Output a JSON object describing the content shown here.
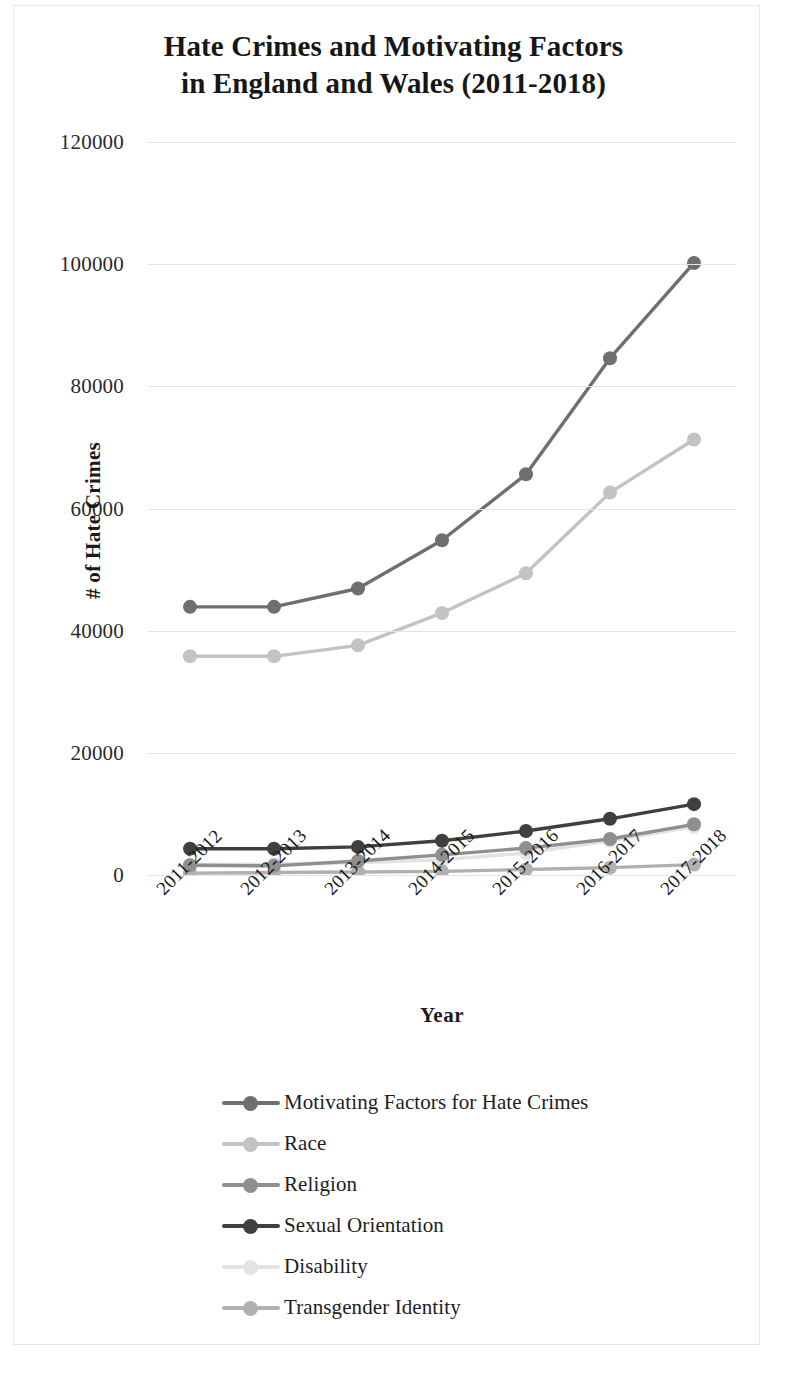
{
  "title": {
    "line1": "Hate Crimes and Motivating Factors",
    "line2": "in England and Wales (2011-2018)"
  },
  "axes": {
    "ylabel": "# of Hate Crimes",
    "xlabel": "Year",
    "yticks": [
      "0",
      "20000",
      "40000",
      "60000",
      "80000",
      "100000",
      "120000"
    ],
    "xticks": [
      "2011-2012",
      "2012-2013",
      "2013-2014",
      "2014-2015",
      "2015-2016",
      "2016-2017",
      "2017-2018"
    ]
  },
  "legend": {
    "items": [
      {
        "label": "Motivating Factors for Hate Crimes",
        "color": "#6f6f6f"
      },
      {
        "label": "Race",
        "color": "#c3c3c3"
      },
      {
        "label": "Religion",
        "color": "#8f8f8f"
      },
      {
        "label": "Sexual Orientation",
        "color": "#3f3f3f"
      },
      {
        "label": "Disability",
        "color": "#e3e3e3"
      },
      {
        "label": "Transgender Identity",
        "color": "#b0b0b0"
      }
    ]
  },
  "chart_data": {
    "type": "line",
    "title": "Hate Crimes and Motivating Factors in England and Wales (2011-2018)",
    "xlabel": "Year",
    "ylabel": "# of Hate Crimes",
    "categories": [
      "2011-2012",
      "2012-2013",
      "2013-2014",
      "2014-2015",
      "2015-2016",
      "2016-2017",
      "2017-2018"
    ],
    "ylim": [
      0,
      120000
    ],
    "ytick_step": 20000,
    "grid": true,
    "legend_position": "bottom",
    "marker": "circle",
    "series": [
      {
        "name": "Motivating Factors for Hate Crimes",
        "color": "#6f6f6f",
        "values": [
          43900,
          43900,
          46900,
          54800,
          65600,
          84600,
          100200
        ]
      },
      {
        "name": "Race",
        "color": "#c3c3c3",
        "values": [
          35800,
          35800,
          37600,
          42900,
          49400,
          62600,
          71300
        ]
      },
      {
        "name": "Religion",
        "color": "#8f8f8f",
        "values": [
          1600,
          1500,
          2300,
          3300,
          4400,
          5900,
          8300
        ]
      },
      {
        "name": "Sexual Orientation",
        "color": "#3f3f3f",
        "values": [
          4300,
          4300,
          4600,
          5600,
          7200,
          9200,
          11600
        ]
      },
      {
        "name": "Disability",
        "color": "#e3e3e3",
        "values": [
          1700,
          1800,
          2000,
          2500,
          3600,
          5600,
          7900
        ]
      },
      {
        "name": "Transgender Identity",
        "color": "#b0b0b0",
        "values": [
          300,
          400,
          500,
          600,
          900,
          1200,
          1700
        ]
      }
    ]
  }
}
